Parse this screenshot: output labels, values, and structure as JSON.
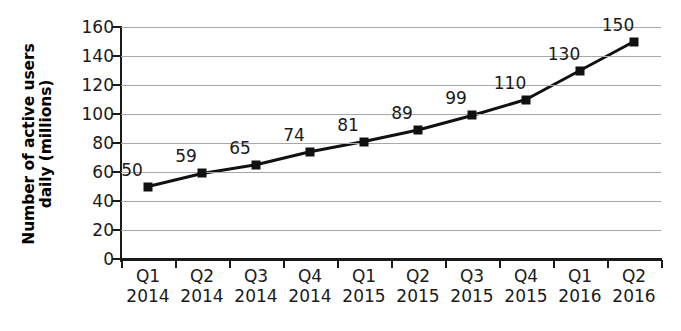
{
  "chart_data": {
    "type": "line",
    "title": "",
    "xlabel": "",
    "ylabel": "Number of active users daily (millions)",
    "ylabel_line1": "Number of active users",
    "ylabel_line2": "daily (millions)",
    "ylim": [
      0,
      160
    ],
    "ytick_step": 20,
    "yticks": [
      0,
      20,
      40,
      60,
      80,
      100,
      120,
      140,
      160
    ],
    "ytick_labels": [
      "0",
      "20",
      "40",
      "60",
      "80",
      "100",
      "120",
      "140",
      "160"
    ],
    "grid": true,
    "legend": "none",
    "categories": [
      "Q1 2014",
      "Q2 2014",
      "Q3 2014",
      "Q4 2014",
      "Q1 2015",
      "Q2 2015",
      "Q3 2015",
      "Q4 2015",
      "Q1 2016",
      "Q2 2016"
    ],
    "category_quarters": [
      "Q1",
      "Q2",
      "Q3",
      "Q4",
      "Q1",
      "Q2",
      "Q3",
      "Q4",
      "Q1",
      "Q2"
    ],
    "category_years": [
      "2014",
      "2014",
      "2014",
      "2014",
      "2015",
      "2015",
      "2015",
      "2015",
      "2016",
      "2016"
    ],
    "values": [
      50,
      59,
      65,
      74,
      81,
      89,
      99,
      110,
      130,
      150
    ],
    "data_labels": [
      "50",
      "59",
      "65",
      "74",
      "81",
      "89",
      "99",
      "110",
      "130",
      "150"
    ],
    "series_name": "Active users daily",
    "colors": {
      "line": "#111111",
      "marker": "#111111",
      "gridline": "#a8a8a8",
      "axis": "#1a1a1a",
      "text": "#1a1a1a",
      "background": "#ffffff"
    },
    "marker_style": "square"
  }
}
